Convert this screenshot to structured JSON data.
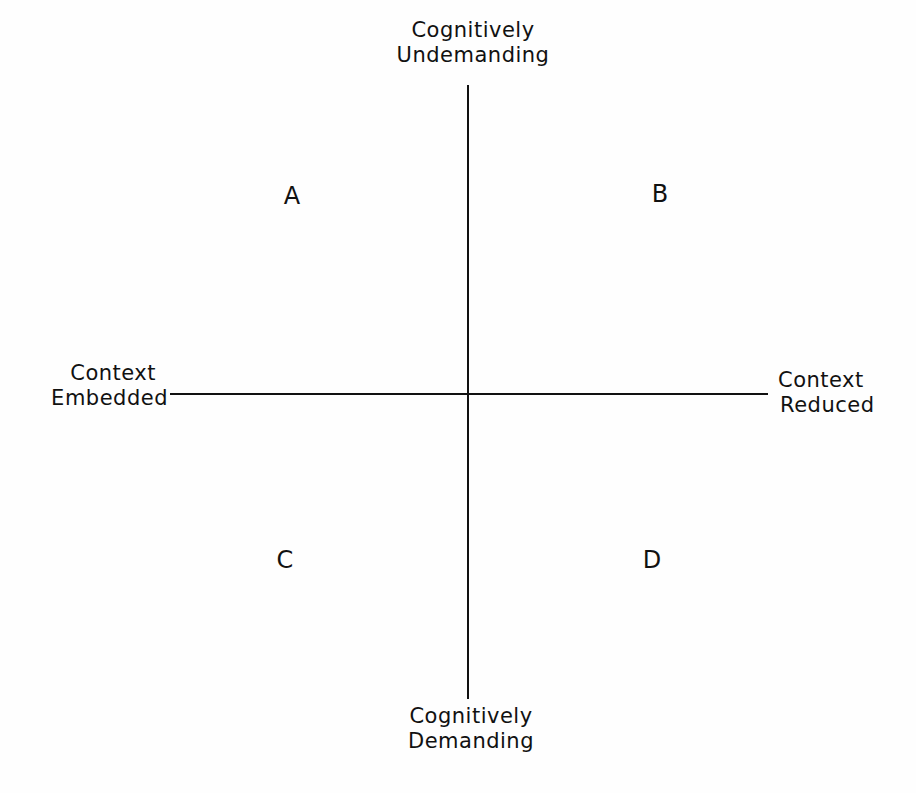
{
  "diagram": {
    "type": "quadrant",
    "axes": {
      "vertical": {
        "top_label": [
          "Cognitively",
          "Undemanding"
        ],
        "bottom_label": [
          "Cognitively",
          "Demanding"
        ]
      },
      "horizontal": {
        "left_label": [
          "Context",
          "Embedded"
        ],
        "right_label": [
          "Context",
          "Reduced"
        ]
      }
    },
    "quadrants": {
      "top_left": "A",
      "top_right": "B",
      "bottom_left": "C",
      "bottom_right": "D"
    },
    "colors": {
      "background": "#fefefe",
      "ink": "#111111"
    }
  }
}
